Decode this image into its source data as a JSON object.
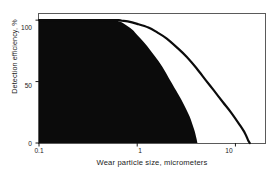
{
  "chart_data": {
    "type": "line",
    "title": "",
    "subtitle": "",
    "xlabel": "Wear particle size, micrometers",
    "ylabel": "Detection efficiency, %",
    "xscale": "log",
    "xlim": [
      0.1,
      20
    ],
    "ylim": [
      0,
      105
    ],
    "grid": false,
    "legend": null,
    "xticks": [
      0.1,
      1,
      10
    ],
    "xticklabels": [
      "0.1",
      "1",
      "10"
    ],
    "yticks": [
      0,
      50,
      100
    ],
    "yticklabels": [
      "0",
      "50",
      "100"
    ],
    "series": [
      {
        "name": "filled-region-curve",
        "style": "filled-area",
        "fill_color": "#0b0b0b",
        "x": [
          0.1,
          0.2,
          0.3,
          0.4,
          0.5,
          0.6,
          0.65,
          0.7,
          0.8,
          0.9,
          1.0,
          1.2,
          1.5,
          1.8,
          2.2,
          2.6,
          3.0,
          3.4,
          3.8,
          4.0,
          4.1
        ],
        "values": [
          100,
          100,
          100,
          100,
          100,
          100,
          99,
          98,
          95,
          92,
          88,
          81,
          71,
          62,
          50,
          40,
          31,
          22,
          11,
          4,
          0
        ]
      },
      {
        "name": "outer-curve",
        "style": "line",
        "line_color": "#0b0b0b",
        "x": [
          0.1,
          0.2,
          0.3,
          0.4,
          0.5,
          0.6,
          0.65,
          0.7,
          0.8,
          1.0,
          1.3,
          1.6,
          2.0,
          2.6,
          3.2,
          4.0,
          5.0,
          6.0,
          7.5,
          9.0,
          11.0,
          12.5,
          13.5,
          14.0
        ],
        "values": [
          100,
          100,
          100,
          100,
          100,
          100,
          100,
          99.5,
          99,
          97,
          94,
          90,
          85,
          77,
          70,
          61,
          51,
          43,
          33,
          25,
          15,
          8,
          2,
          0
        ]
      }
    ]
  },
  "axes": {
    "x_title": "Wear particle size, micrometers",
    "y_title": "Detection efficiency, %",
    "x_tick_labels": [
      "0.1",
      "1",
      "10"
    ],
    "y_tick_labels": [
      "100",
      "50",
      "0"
    ]
  },
  "colors": {
    "fill": "#0b0b0b",
    "line": "#0b0b0b",
    "frame": "#5a5a5a",
    "background": "#ffffff",
    "text": "#1a1a1a"
  }
}
